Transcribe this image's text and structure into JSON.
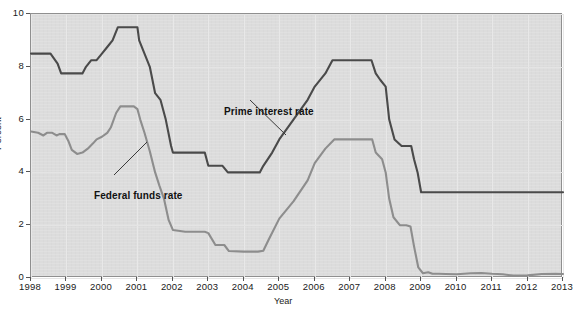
{
  "chart_data": {
    "type": "line",
    "title": "",
    "xlabel": "Year",
    "ylabel": "Percent",
    "xlim": [
      1998,
      2013
    ],
    "ylim": [
      0,
      10
    ],
    "ytick_labels": [
      "0",
      "2",
      "4",
      "6",
      "8",
      "10"
    ],
    "ytick_values": [
      0,
      2,
      4,
      6,
      8,
      10
    ],
    "xtick_labels": [
      "1998",
      "1999",
      "2000",
      "2001",
      "2002",
      "2003",
      "2004",
      "2005",
      "2006",
      "2007",
      "2008",
      "2009",
      "2010",
      "2011",
      "2012",
      "2013"
    ],
    "xtick_values": [
      1998,
      1999,
      2000,
      2001,
      2002,
      2003,
      2004,
      2005,
      2006,
      2007,
      2008,
      2009,
      2010,
      2011,
      2012,
      2013
    ],
    "grid": true,
    "legend": "annotations",
    "plot_background": "#dcdcdc",
    "series": [
      {
        "name": "Prime interest rate",
        "color": "#4a4a4a",
        "label_position": "inside-upper-middle",
        "points": [
          [
            1998.0,
            8.5
          ],
          [
            1998.55,
            8.5
          ],
          [
            1998.75,
            8.12
          ],
          [
            1998.85,
            7.75
          ],
          [
            1999.0,
            7.75
          ],
          [
            1999.45,
            7.75
          ],
          [
            1999.55,
            8.0
          ],
          [
            1999.7,
            8.25
          ],
          [
            1999.85,
            8.25
          ],
          [
            2000.0,
            8.5
          ],
          [
            2000.15,
            8.75
          ],
          [
            2000.3,
            9.0
          ],
          [
            2000.45,
            9.5
          ],
          [
            2000.6,
            9.5
          ],
          [
            2000.9,
            9.5
          ],
          [
            2001.0,
            9.5
          ],
          [
            2001.05,
            9.0
          ],
          [
            2001.2,
            8.5
          ],
          [
            2001.35,
            8.0
          ],
          [
            2001.5,
            7.0
          ],
          [
            2001.65,
            6.75
          ],
          [
            2001.8,
            6.0
          ],
          [
            2001.95,
            5.0
          ],
          [
            2002.0,
            4.75
          ],
          [
            2002.4,
            4.75
          ],
          [
            2002.9,
            4.75
          ],
          [
            2003.0,
            4.25
          ],
          [
            2003.4,
            4.25
          ],
          [
            2003.55,
            4.0
          ],
          [
            2004.0,
            4.0
          ],
          [
            2004.45,
            4.0
          ],
          [
            2004.55,
            4.25
          ],
          [
            2004.8,
            4.75
          ],
          [
            2005.0,
            5.25
          ],
          [
            2005.4,
            6.0
          ],
          [
            2005.8,
            6.75
          ],
          [
            2006.0,
            7.25
          ],
          [
            2006.3,
            7.75
          ],
          [
            2006.5,
            8.25
          ],
          [
            2006.9,
            8.25
          ],
          [
            2007.4,
            8.25
          ],
          [
            2007.6,
            8.25
          ],
          [
            2007.72,
            7.75
          ],
          [
            2007.85,
            7.5
          ],
          [
            2008.0,
            7.25
          ],
          [
            2008.1,
            6.0
          ],
          [
            2008.25,
            5.25
          ],
          [
            2008.45,
            5.0
          ],
          [
            2008.6,
            5.0
          ],
          [
            2008.72,
            5.0
          ],
          [
            2008.8,
            4.5
          ],
          [
            2008.9,
            4.0
          ],
          [
            2009.0,
            3.25
          ],
          [
            2009.2,
            3.25
          ],
          [
            2010.0,
            3.25
          ],
          [
            2011.0,
            3.25
          ],
          [
            2012.0,
            3.25
          ],
          [
            2013.0,
            3.25
          ]
        ]
      },
      {
        "name": "Federal funds rate",
        "color": "#8d8d8d",
        "label_position": "inside-left-lower",
        "points": [
          [
            1998.0,
            5.55
          ],
          [
            1998.2,
            5.5
          ],
          [
            1998.35,
            5.4
          ],
          [
            1998.45,
            5.5
          ],
          [
            1998.6,
            5.5
          ],
          [
            1998.72,
            5.4
          ],
          [
            1998.8,
            5.45
          ],
          [
            1998.95,
            5.45
          ],
          [
            1999.05,
            5.2
          ],
          [
            1999.15,
            4.85
          ],
          [
            1999.3,
            4.7
          ],
          [
            1999.45,
            4.75
          ],
          [
            1999.6,
            4.9
          ],
          [
            1999.75,
            5.1
          ],
          [
            1999.85,
            5.25
          ],
          [
            2000.0,
            5.35
          ],
          [
            2000.15,
            5.5
          ],
          [
            2000.25,
            5.7
          ],
          [
            2000.4,
            6.25
          ],
          [
            2000.52,
            6.5
          ],
          [
            2000.7,
            6.5
          ],
          [
            2000.9,
            6.5
          ],
          [
            2001.0,
            6.4
          ],
          [
            2001.08,
            6.0
          ],
          [
            2001.2,
            5.5
          ],
          [
            2001.35,
            4.8
          ],
          [
            2001.5,
            4.0
          ],
          [
            2001.62,
            3.5
          ],
          [
            2001.75,
            3.0
          ],
          [
            2001.88,
            2.2
          ],
          [
            2002.0,
            1.82
          ],
          [
            2002.35,
            1.75
          ],
          [
            2002.75,
            1.75
          ],
          [
            2002.9,
            1.75
          ],
          [
            2003.0,
            1.7
          ],
          [
            2003.2,
            1.25
          ],
          [
            2003.45,
            1.25
          ],
          [
            2003.58,
            1.02
          ],
          [
            2004.0,
            1.0
          ],
          [
            2004.4,
            1.0
          ],
          [
            2004.55,
            1.03
          ],
          [
            2004.7,
            1.45
          ],
          [
            2005.0,
            2.25
          ],
          [
            2005.4,
            2.9
          ],
          [
            2005.8,
            3.7
          ],
          [
            2006.0,
            4.35
          ],
          [
            2006.3,
            4.9
          ],
          [
            2006.55,
            5.25
          ],
          [
            2006.9,
            5.25
          ],
          [
            2007.4,
            5.25
          ],
          [
            2007.62,
            5.25
          ],
          [
            2007.72,
            4.75
          ],
          [
            2007.9,
            4.5
          ],
          [
            2008.0,
            4.0
          ],
          [
            2008.1,
            3.0
          ],
          [
            2008.22,
            2.3
          ],
          [
            2008.4,
            2.0
          ],
          [
            2008.58,
            2.0
          ],
          [
            2008.7,
            1.95
          ],
          [
            2008.8,
            1.2
          ],
          [
            2008.92,
            0.4
          ],
          [
            2009.05,
            0.18
          ],
          [
            2009.2,
            0.22
          ],
          [
            2009.32,
            0.16
          ],
          [
            2009.5,
            0.16
          ],
          [
            2009.7,
            0.15
          ],
          [
            2010.0,
            0.14
          ],
          [
            2010.4,
            0.18
          ],
          [
            2010.7,
            0.19
          ],
          [
            2011.0,
            0.16
          ],
          [
            2011.3,
            0.14
          ],
          [
            2011.6,
            0.09
          ],
          [
            2012.0,
            0.1
          ],
          [
            2012.4,
            0.15
          ],
          [
            2012.8,
            0.16
          ],
          [
            2013.0,
            0.15
          ]
        ]
      }
    ],
    "annotations": [
      {
        "text": "Prime interest rate",
        "leader_from": [
          249,
          99
        ],
        "leader_to": [
          285,
          134
        ]
      },
      {
        "text": "Federal funds rate",
        "leader_from": [
          113,
          174
        ],
        "leader_to": [
          146,
          141
        ]
      }
    ]
  }
}
